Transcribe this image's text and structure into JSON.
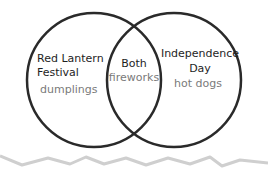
{
  "diagram": {
    "type": "venn",
    "sets": [
      {
        "id": "left",
        "title_lines": [
          "Red Lantern",
          "Festival"
        ],
        "items": [
          "dumplings"
        ]
      },
      {
        "id": "right",
        "title_lines": [
          "Independence",
          "Day"
        ],
        "items": [
          "hot dogs"
        ]
      }
    ],
    "intersection": {
      "title": "Both",
      "items": [
        "fireworks"
      ]
    },
    "colors": {
      "circle_stroke": "#2a2a2a",
      "title_text": "#1e1e1e",
      "item_text": "#7a7a7a",
      "zigzag": "#cfcfcf"
    }
  }
}
